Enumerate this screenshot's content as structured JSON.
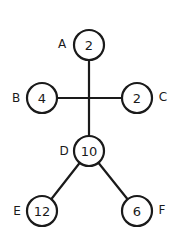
{
  "diagram": {
    "type": "tree",
    "nodes": [
      {
        "id": "A",
        "label": "A",
        "value": "2",
        "cx": 89,
        "cy": 45,
        "label_side": "left"
      },
      {
        "id": "B",
        "label": "B",
        "value": "4",
        "cx": 42,
        "cy": 98,
        "label_side": "left"
      },
      {
        "id": "C",
        "label": "C",
        "value": "2",
        "cx": 137,
        "cy": 98,
        "label_side": "right"
      },
      {
        "id": "D",
        "label": "D",
        "value": "10",
        "cx": 89,
        "cy": 151,
        "label_side": "left"
      },
      {
        "id": "E",
        "label": "E",
        "value": "12",
        "cx": 42,
        "cy": 211,
        "label_side": "left"
      },
      {
        "id": "F",
        "label": "F",
        "value": "6",
        "cx": 137,
        "cy": 211,
        "label_side": "right"
      }
    ],
    "junction": {
      "x": 89,
      "y": 98
    },
    "edges": [
      {
        "from": "A",
        "to": "junction"
      },
      {
        "from": "B",
        "to": "junction"
      },
      {
        "from": "C",
        "to": "junction"
      },
      {
        "from": "junction",
        "to": "D"
      },
      {
        "from": "D",
        "to": "E"
      },
      {
        "from": "D",
        "to": "F"
      }
    ],
    "node_radius": 15,
    "colors": {
      "stroke": "#1a1a1a",
      "fill": "#ffffff",
      "background": "#ffffff"
    }
  }
}
